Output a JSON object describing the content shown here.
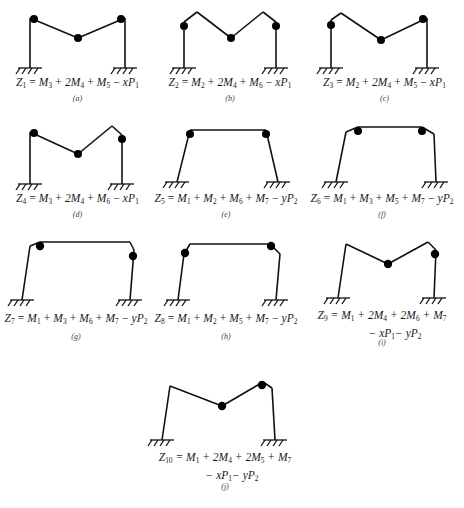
{
  "figure": {
    "type": "structural-collapse-mechanisms",
    "panel_count": 10,
    "line_color": "#111111",
    "hinge_color": "#000000",
    "background": "#ffffff"
  },
  "panels": [
    {
      "id": "a",
      "sublabel": "(a)",
      "equation": "Z1 = M3 + 2M4 + M5 - xP1",
      "lhs": "Z",
      "lhs_sub": "1",
      "terms": [
        "M3",
        "2M4",
        "M5",
        "-xP1"
      ],
      "mechanism": "beam"
    },
    {
      "id": "b",
      "sublabel": "(b)",
      "equation": "Z2 = M2 + 2M4 + M6 - xP1",
      "lhs": "Z",
      "lhs_sub": "2",
      "terms": [
        "M2",
        "2M4",
        "M6",
        "-xP1"
      ],
      "mechanism": "beam"
    },
    {
      "id": "c",
      "sublabel": "(c)",
      "equation": "Z3 = M2 + 2M4 + M5 - xP1",
      "lhs": "Z",
      "lhs_sub": "3",
      "terms": [
        "M2",
        "2M4",
        "M5",
        "-xP1"
      ],
      "mechanism": "beam"
    },
    {
      "id": "d",
      "sublabel": "(d)",
      "equation": "Z4 = M3 + 2M4 + M6 - xP1",
      "lhs": "Z",
      "lhs_sub": "4",
      "terms": [
        "M3",
        "2M4",
        "M6",
        "-xP1"
      ],
      "mechanism": "beam"
    },
    {
      "id": "e",
      "sublabel": "(e)",
      "equation": "Z5 = M1 + M2 + M6 + M7 - yP2",
      "lhs": "Z",
      "lhs_sub": "5",
      "terms": [
        "M1",
        "M2",
        "M6",
        "M7",
        "-yP2"
      ],
      "mechanism": "sway"
    },
    {
      "id": "f",
      "sublabel": "(f)",
      "equation": "Z6 = M1 + M3 + M5 + M7 - yP2",
      "lhs": "Z",
      "lhs_sub": "6",
      "terms": [
        "M1",
        "M3",
        "M5",
        "M7",
        "-yP2"
      ],
      "mechanism": "sway"
    },
    {
      "id": "g",
      "sublabel": "(g)",
      "equation": "Z7 = M1 + M3 + M6 + M7 - yP2",
      "lhs": "Z",
      "lhs_sub": "7",
      "terms": [
        "M1",
        "M3",
        "M6",
        "M7",
        "-yP2"
      ],
      "mechanism": "sway"
    },
    {
      "id": "h",
      "sublabel": "(h)",
      "equation": "Z8 = M1 + M2 + M5 + M7 - yP2",
      "lhs": "Z",
      "lhs_sub": "8",
      "terms": [
        "M1",
        "M2",
        "M5",
        "M7",
        "-yP2"
      ],
      "mechanism": "sway"
    },
    {
      "id": "i",
      "sublabel": "(i)",
      "equation_line1": "Z9 = M1 + 2M4 + 2M6 + M7",
      "equation_line2": "- xP1 - yP2",
      "lhs": "Z",
      "lhs_sub": "9",
      "terms": [
        "M1",
        "2M4",
        "2M6",
        "M7",
        "-xP1",
        "-yP2"
      ],
      "mechanism": "combined"
    },
    {
      "id": "j",
      "sublabel": "(j)",
      "equation_line1": "Z10 = M1 + 2M4 + 2M5 + M7",
      "equation_line2": "- xP1 - yP2",
      "lhs": "Z",
      "lhs_sub": "10",
      "terms": [
        "M1",
        "2M4",
        "2M5",
        "M7",
        "-xP1",
        "-yP2"
      ],
      "mechanism": "combined"
    }
  ],
  "symbols": {
    "Z": "Z",
    "M": "M",
    "P": "P",
    "x": "x",
    "y": "y",
    "plus": "+",
    "minus": "−",
    "equals": "="
  }
}
